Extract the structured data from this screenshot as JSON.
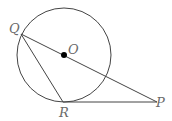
{
  "diagram": {
    "type": "geometry",
    "circle": {
      "center_label": "O",
      "cx": 64,
      "cy": 55,
      "r": 47
    },
    "points": {
      "Q": {
        "label": "Q",
        "x": 21,
        "y": 34
      },
      "O": {
        "label": "O",
        "x": 64,
        "y": 55
      },
      "R": {
        "label": "R",
        "x": 63,
        "y": 102
      },
      "P": {
        "label": "P",
        "x": 157,
        "y": 102
      }
    },
    "segments": [
      "QP",
      "QR",
      "RP"
    ],
    "stroke_color": "#444444",
    "label_color": "#6a6a6a"
  }
}
